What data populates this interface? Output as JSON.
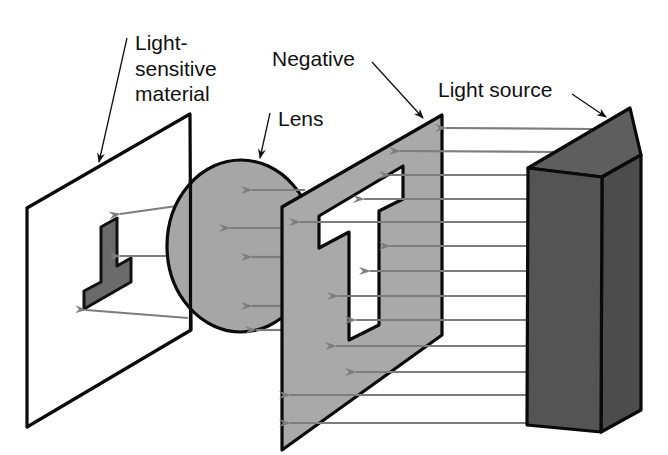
{
  "diagram": {
    "labels": {
      "material": [
        "Light-",
        "sensitive",
        "material"
      ],
      "lens": "Lens",
      "negative": "Negative",
      "light_source": "Light source"
    },
    "colors": {
      "background": "#ffffff",
      "outline": "#0a0a0a",
      "negative_fill": "#a9a9a9",
      "lens_fill": "#a6a6a6",
      "light_source_front": "#545454",
      "light_source_top": "#5e5e5e",
      "light_source_side": "#4c4c4c",
      "image_fill": "#6b6b6b",
      "ray": "#7d7d7d"
    },
    "components": [
      {
        "id": "light-sensitive-material",
        "label": "Light-sensitive material"
      },
      {
        "id": "lens",
        "label": "Lens"
      },
      {
        "id": "negative",
        "label": "Negative"
      },
      {
        "id": "light-source",
        "label": "Light source"
      }
    ],
    "ray_rows_y": [
      128,
      151,
      175,
      199,
      222,
      246,
      271,
      296,
      320,
      346,
      372,
      395
    ]
  }
}
